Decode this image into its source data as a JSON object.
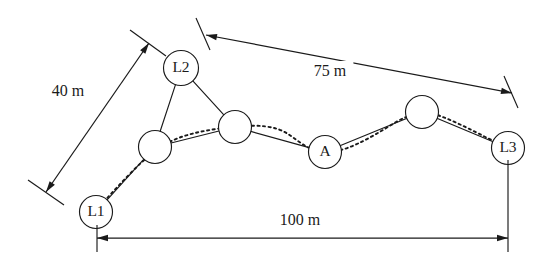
{
  "diagram": {
    "background_color": "#ffffff",
    "stroke_color": "#1a1a1a",
    "width": 552,
    "height": 264
  },
  "nodes": [
    {
      "id": "L1",
      "label": "L1",
      "cx": 96,
      "cy": 212,
      "r": 16.5,
      "kind": "landmark",
      "labeled": true
    },
    {
      "id": "N1",
      "label": "",
      "cx": 155,
      "cy": 147,
      "r": 16.5,
      "kind": "relay",
      "labeled": false
    },
    {
      "id": "L2",
      "label": "L2",
      "cx": 181,
      "cy": 68,
      "r": 17.5,
      "kind": "landmark",
      "labeled": true
    },
    {
      "id": "N2",
      "label": "",
      "cx": 235,
      "cy": 127,
      "r": 16.5,
      "kind": "relay",
      "labeled": false
    },
    {
      "id": "A",
      "label": "A",
      "cx": 325,
      "cy": 152,
      "r": 16.5,
      "kind": "target",
      "labeled": true
    },
    {
      "id": "N3",
      "label": "",
      "cx": 422,
      "cy": 112,
      "r": 16.5,
      "kind": "relay",
      "labeled": false
    },
    {
      "id": "L3",
      "label": "L3",
      "cx": 508,
      "cy": 148,
      "r": 16.5,
      "kind": "landmark",
      "labeled": true
    }
  ],
  "edges": [
    {
      "from": "L1",
      "to": "N1"
    },
    {
      "from": "N1",
      "to": "L2"
    },
    {
      "from": "L2",
      "to": "N2"
    },
    {
      "from": "N1",
      "to": "N2"
    },
    {
      "from": "N2",
      "to": "A"
    },
    {
      "from": "A",
      "to": "N3"
    },
    {
      "from": "N3",
      "to": "L3"
    }
  ],
  "trajectory": {
    "style": "dotted",
    "description": "dotted path traversing L1 through relay nodes to L3",
    "path": "M 100 206 C 118 186, 140 162, 156 150 C 178 134, 206 130, 232 127 C 258 124, 276 126, 288 134 C 300 142, 308 150, 322 152 C 344 154, 370 138, 396 122 C 410 114, 424 110, 440 116 C 462 124, 486 138, 504 146"
  },
  "dimensions": [
    {
      "id": "dim-40m",
      "label": "40 m",
      "value": 40,
      "unit": "m",
      "orientation": "diagonal",
      "label_x": 68,
      "label_y": 92,
      "line": {
        "x1": 46,
        "y1": 192,
        "x2": 149,
        "y2": 43
      },
      "ext_a": {
        "x1": 28,
        "y1": 180,
        "x2": 64,
        "y2": 205
      },
      "ext_b": {
        "x1": 130,
        "y1": 30,
        "x2": 166,
        "y2": 56
      },
      "arrows": "both"
    },
    {
      "id": "dim-75m",
      "label": "75 m",
      "value": 75,
      "unit": "m",
      "orientation": "diagonal",
      "label_x": 330,
      "label_y": 72,
      "line": {
        "x1": 206,
        "y1": 35,
        "x2": 512,
        "y2": 93
      },
      "ext_a": {
        "x1": 196,
        "y1": 18,
        "x2": 210,
        "y2": 50
      },
      "ext_b": {
        "x1": 504,
        "y1": 76,
        "x2": 518,
        "y2": 108
      },
      "arrows": "both"
    },
    {
      "id": "dim-100m",
      "label": "100 m",
      "value": 100,
      "unit": "m",
      "orientation": "horizontal",
      "label_x": 300,
      "label_y": 221,
      "line": {
        "x1": 97,
        "y1": 238,
        "x2": 508,
        "y2": 238
      },
      "ext_a": {
        "x1": 97,
        "y1": 225,
        "x2": 97,
        "y2": 252
      },
      "ext_b": {
        "x1": 508,
        "y1": 160,
        "x2": 508,
        "y2": 252
      },
      "arrows": "both"
    }
  ]
}
